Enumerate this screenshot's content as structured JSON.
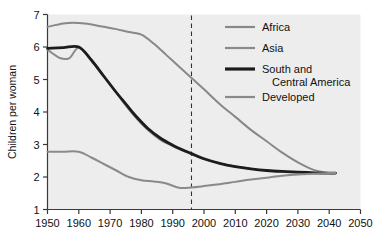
{
  "chart_data": {
    "type": "line",
    "title": "",
    "xlabel": "",
    "ylabel": "Children per woman",
    "xlim": [
      1950,
      2050
    ],
    "ylim": [
      1,
      7
    ],
    "xticks": [
      1950,
      1960,
      1970,
      1980,
      1990,
      2000,
      2010,
      2020,
      2030,
      2040,
      2050
    ],
    "yticks": [
      1,
      2,
      3,
      4,
      5,
      6,
      7
    ],
    "grid": false,
    "legend_position": "top-right",
    "plot_background": "#ededed",
    "annotations": [
      {
        "name": "projection-divider",
        "type": "vertical-dashed-line",
        "x": 1996,
        "color": "#333333"
      }
    ],
    "series": [
      {
        "name": "Africa",
        "color": "#888888",
        "width": 2.0,
        "x": [
          1950,
          1955,
          1958,
          1962,
          1968,
          1972,
          1976,
          1980,
          1984,
          1988,
          1992,
          1996,
          2000,
          2005,
          2010,
          2015,
          2020,
          2025,
          2030,
          2035,
          2040,
          2042
        ],
        "y": [
          6.62,
          6.72,
          6.75,
          6.72,
          6.62,
          6.55,
          6.46,
          6.38,
          6.1,
          5.75,
          5.4,
          5.05,
          4.7,
          4.25,
          3.85,
          3.45,
          3.1,
          2.75,
          2.45,
          2.22,
          2.12,
          2.12
        ]
      },
      {
        "name": "Asia",
        "color": "#8a8a8a",
        "width": 2.0,
        "x": [
          1950,
          1954,
          1957,
          1960,
          1964,
          1968,
          1972,
          1975,
          1978,
          1982,
          1986,
          1990,
          1994,
          1996,
          2000,
          2005,
          2010,
          2015,
          2020,
          2025,
          2030,
          2035,
          2040,
          2042
        ],
        "y": [
          5.92,
          5.66,
          5.66,
          5.98,
          5.6,
          5.1,
          4.6,
          4.2,
          3.85,
          3.45,
          3.15,
          2.95,
          2.78,
          2.7,
          2.55,
          2.42,
          2.32,
          2.25,
          2.2,
          2.16,
          2.14,
          2.13,
          2.12,
          2.12
        ]
      },
      {
        "name": "South and Central America",
        "color": "#1c1c1c",
        "width": 2.8,
        "x": [
          1950,
          1955,
          1960,
          1964,
          1968,
          1972,
          1975,
          1978,
          1982,
          1986,
          1990,
          1994,
          1996,
          2000,
          2005,
          2010,
          2015,
          2020,
          2025,
          2030,
          2035,
          2040,
          2042
        ],
        "y": [
          5.96,
          5.98,
          6.0,
          5.6,
          5.1,
          4.6,
          4.25,
          3.9,
          3.5,
          3.2,
          2.98,
          2.8,
          2.72,
          2.56,
          2.42,
          2.32,
          2.25,
          2.2,
          2.17,
          2.15,
          2.13,
          2.12,
          2.12
        ]
      },
      {
        "name": "Developed",
        "color": "#8a8a8a",
        "width": 2.0,
        "x": [
          1950,
          1955,
          1960,
          1964,
          1968,
          1972,
          1976,
          1980,
          1984,
          1988,
          1992,
          1996,
          2000,
          2005,
          2010,
          2015,
          2020,
          2025,
          2030,
          2035,
          2040,
          2042
        ],
        "y": [
          2.78,
          2.78,
          2.78,
          2.6,
          2.4,
          2.2,
          2.0,
          1.9,
          1.86,
          1.8,
          1.67,
          1.68,
          1.72,
          1.78,
          1.85,
          1.92,
          1.98,
          2.04,
          2.08,
          2.1,
          2.12,
          2.12
        ]
      }
    ],
    "legend": [
      {
        "label": "Africa",
        "color": "#888888",
        "width": 2.2
      },
      {
        "label": "Asia",
        "color": "#8a8a8a",
        "width": 2.2
      },
      {
        "label": "South and",
        "label2": "Central America",
        "color": "#1c1c1c",
        "width": 3.2
      },
      {
        "label": "Developed",
        "color": "#8a8a8a",
        "width": 2.2
      }
    ]
  }
}
